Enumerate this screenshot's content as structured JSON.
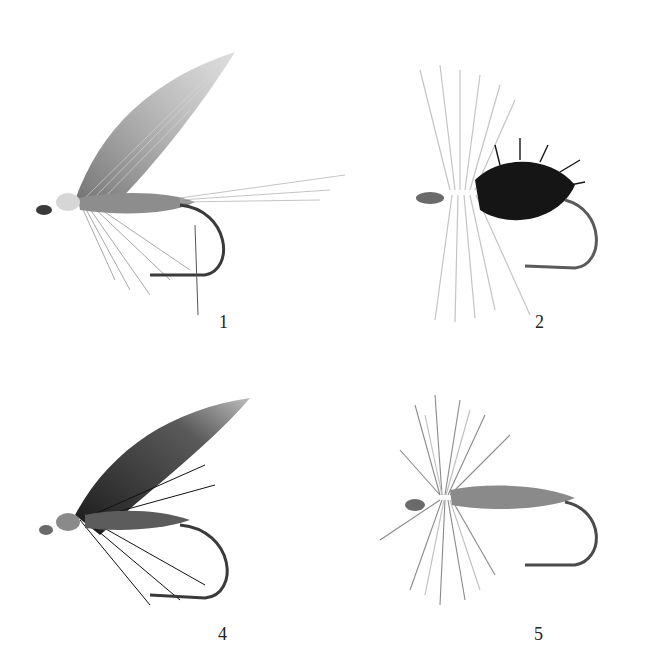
{
  "plate": {
    "background": "#ffffff",
    "figures": [
      {
        "label": "1",
        "description": "wet fly with grey slanted wing, pale head, grey hackle, long tail whisks"
      },
      {
        "label": "2",
        "description": "dry fly with pale upright wing/hackle and dark palmered black body"
      },
      {
        "label": "4",
        "description": "wet fly with dark mottled wing, black hackle, ribbed body"
      },
      {
        "label": "5",
        "description": "dry fly with bushy grizzle hackle and grey dubbed body"
      }
    ]
  },
  "colors": {
    "hook": "#3a3a3a",
    "feather_light": "#bdbdbd",
    "feather_mid": "#8a8a8a",
    "feather_dark": "#1e1e1e",
    "label_text": "#222222"
  }
}
